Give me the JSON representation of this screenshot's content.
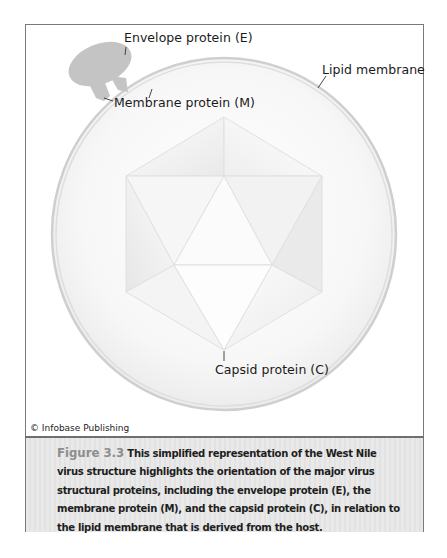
{
  "figure": {
    "labels": {
      "envelope_protein": "Envelope protein (E)",
      "membrane_protein": "Membrane protein (M)",
      "lipid_membrane": "Lipid membrane",
      "capsid_protein": "Capsid protein (C)"
    },
    "credit": "© Infobase Publishing",
    "caption": {
      "figure_number": "Figure 3.3",
      "text": "This simplified representation of the West Nile virus structure highlights the orientation of the major virus structural proteins, including the envelope protein (E), the membrane protein (M), and the capsid protein (C), in relation to the lipid membrane that is derived from the host."
    },
    "colors": {
      "frame": "#7a7a7a",
      "membrane": "#c8c8c8",
      "protein": "#c4c4c4",
      "figure_number": "#8d8d8d",
      "caption_bg": "#e6e6e6"
    }
  }
}
